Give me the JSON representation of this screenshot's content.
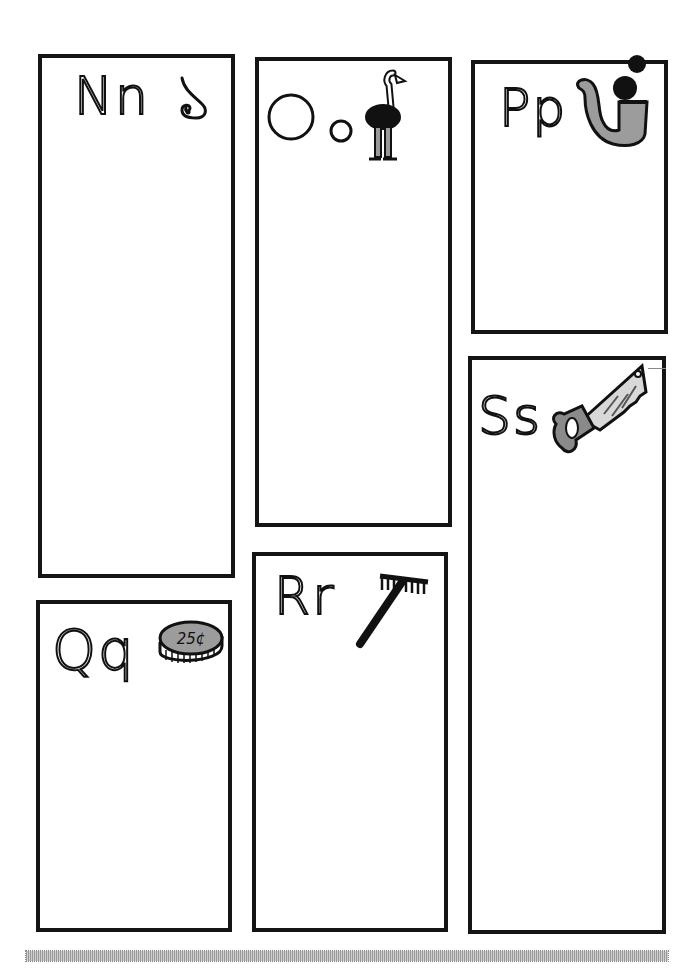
{
  "worksheet": {
    "colors": {
      "border": "#151515",
      "fill_gray": "#9c9c9c",
      "background": "#ffffff"
    },
    "cards": [
      {
        "id": "n",
        "letters": "Nn",
        "picture": "nose"
      },
      {
        "id": "o",
        "letters": "Oo",
        "picture": "ostrich"
      },
      {
        "id": "p",
        "letters": "Pp",
        "picture": "pipe"
      },
      {
        "id": "q",
        "letters": "Qq",
        "picture": "quarter",
        "coin_label": "25¢"
      },
      {
        "id": "r",
        "letters": "Rr",
        "picture": "rake"
      },
      {
        "id": "s",
        "letters": "Ss",
        "picture": "saw"
      }
    ],
    "footer_bar": "dotted-gray-bar"
  }
}
